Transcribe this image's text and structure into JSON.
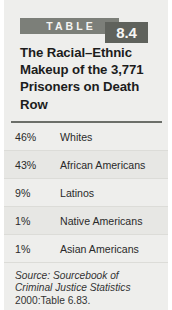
{
  "card": {
    "background": "#eeeeec"
  },
  "badge": {
    "label": "TABLE",
    "number": "8.4",
    "bar_color": "#7c7f79",
    "number_box_color": "#5f625c",
    "text_color": "#f4f4f2"
  },
  "title": "The Racial–Ethnic Makeup of the 3,771 Prisoners on Death Row",
  "table": {
    "rows": [
      {
        "percent": "46%",
        "label": "Whites"
      },
      {
        "percent": "43%",
        "label": "African Americans"
      },
      {
        "percent": "9%",
        "label": "Latinos"
      },
      {
        "percent": "1%",
        "label": "Native Americans"
      },
      {
        "percent": "1%",
        "label": "Asian Americans"
      }
    ]
  },
  "source": {
    "line1": "Source: Sourcebook of",
    "line2": "Criminal Justice Statistics",
    "line3": "2000:Table 6.83."
  },
  "chart_data": {
    "type": "table",
    "title": "The Racial–Ethnic Makeup of the 3,771 Prisoners on Death Row",
    "categories": [
      "Whites",
      "African Americans",
      "Latinos",
      "Native Americans",
      "Asian Americans"
    ],
    "values": [
      46,
      43,
      9,
      1,
      1
    ],
    "xlabel": "",
    "ylabel": "Percent of prisoners on death row",
    "unit": "%",
    "total_prisoners": 3771,
    "source": "Source: Sourcebook of Criminal Justice Statistics 2000:Table 6.83.",
    "grid": false,
    "legend": "none"
  }
}
